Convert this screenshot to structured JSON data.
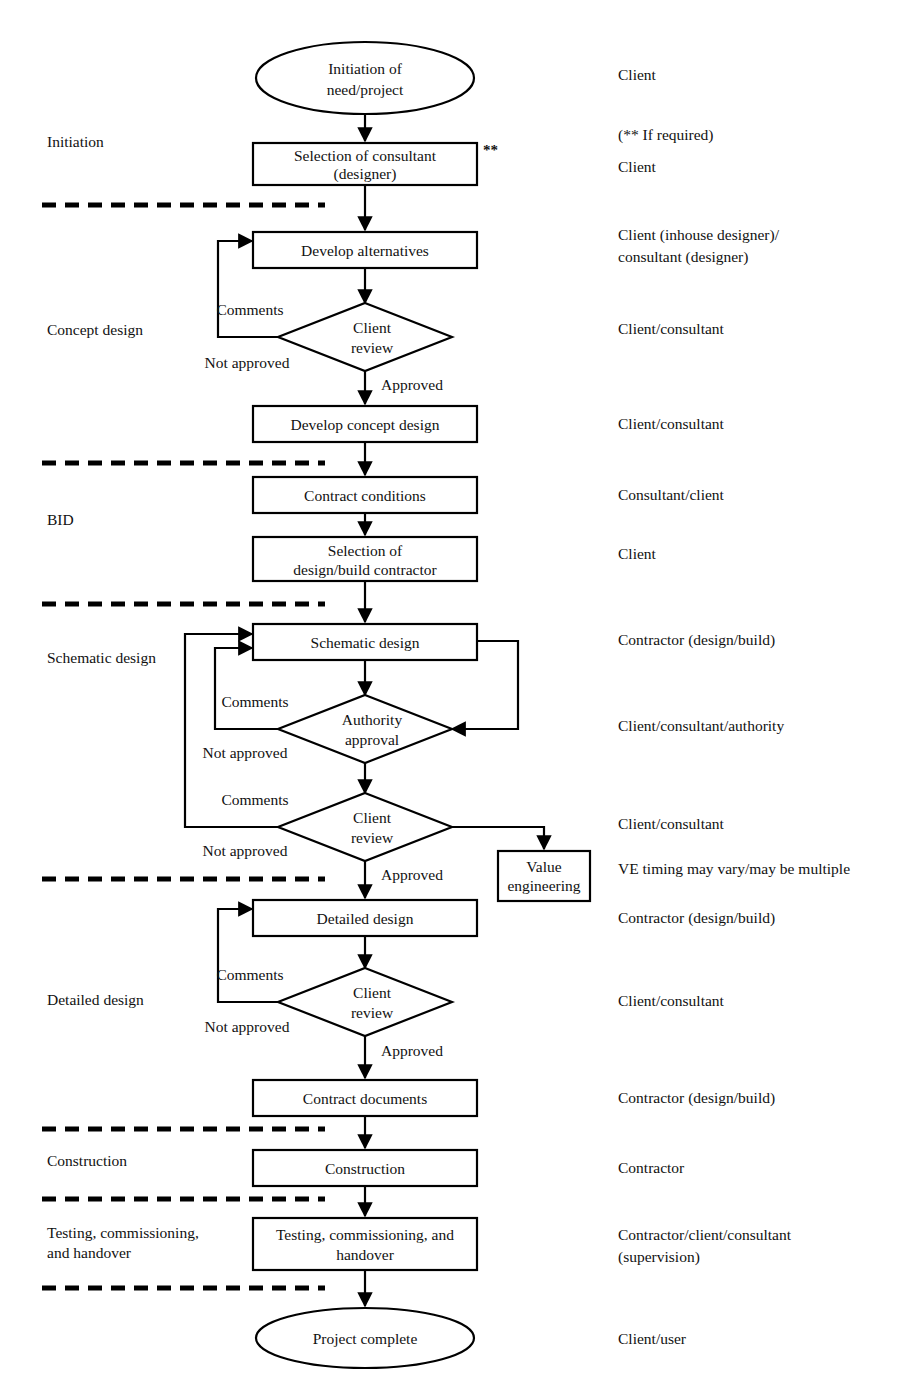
{
  "diagram": {
    "stroke_color": "#000000",
    "fill_color": "#ffffff"
  },
  "nodes": {
    "initiation_of_need": {
      "line1": "Initiation of",
      "line2": "need/project",
      "shape": "ellipse"
    },
    "selection_of_consultant": {
      "line1": "Selection of consultant",
      "line2": "(designer)",
      "shape": "process"
    },
    "develop_alternatives": {
      "line1": "Develop alternatives",
      "shape": "process"
    },
    "client_review_concept": {
      "line1": "Client",
      "line2": "review",
      "shape": "decision"
    },
    "develop_concept_design": {
      "line1": "Develop concept design",
      "shape": "process"
    },
    "contract_conditions": {
      "line1": "Contract conditions",
      "shape": "process"
    },
    "selection_of_contractor": {
      "line1": "Selection of",
      "line2": "design/build contractor",
      "shape": "process"
    },
    "schematic_design": {
      "line1": "Schematic design",
      "shape": "process"
    },
    "authority_approval": {
      "line1": "Authority",
      "line2": "approval",
      "shape": "decision"
    },
    "client_review_schematic": {
      "line1": "Client",
      "line2": "review",
      "shape": "decision"
    },
    "value_engineering": {
      "line1": "Value",
      "line2": "engineering",
      "shape": "process"
    },
    "detailed_design": {
      "line1": "Detailed design",
      "shape": "process"
    },
    "client_review_detailed": {
      "line1": "Client",
      "line2": "review",
      "shape": "decision"
    },
    "contract_documents": {
      "line1": "Contract documents",
      "shape": "process"
    },
    "construction": {
      "line1": "Construction",
      "shape": "process"
    },
    "testing_commissioning": {
      "line1": "Testing, commissioning, and",
      "line2": "handover",
      "shape": "process"
    },
    "project_complete": {
      "line1": "Project complete",
      "shape": "ellipse"
    }
  },
  "markers": {
    "consultant_asterisk": "**"
  },
  "edge_labels": {
    "concept_comments": "Comments",
    "concept_not_approved": "Not approved",
    "concept_approved": "Approved",
    "schematic_authority_comments": "Comments",
    "schematic_authority_not_approved": "Not approved",
    "schematic_client_comments": "Comments",
    "schematic_client_not_approved": "Not approved",
    "schematic_approved": "Approved",
    "detailed_comments": "Comments",
    "detailed_not_approved": "Not approved",
    "detailed_approved": "Approved"
  },
  "phases": [
    {
      "key": "initiation",
      "label": "Initiation"
    },
    {
      "key": "concept_design",
      "label": "Concept design"
    },
    {
      "key": "bid",
      "label": "BID"
    },
    {
      "key": "schematic_design",
      "label": "Schematic design"
    },
    {
      "key": "detailed_design",
      "label": "Detailed design"
    },
    {
      "key": "construction",
      "label": "Construction"
    },
    {
      "key": "testing_l1",
      "label": "Testing, commissioning,"
    },
    {
      "key": "testing_l2",
      "label": "and handover"
    }
  ],
  "actors": [
    {
      "key": "a_initiation",
      "label": "Client"
    },
    {
      "key": "a_if_required",
      "label": "(**  If required)"
    },
    {
      "key": "a_selection_consultant",
      "label": "Client"
    },
    {
      "key": "a_alternatives_l1",
      "label": "Client (inhouse designer)/"
    },
    {
      "key": "a_alternatives_l2",
      "label": "consultant (designer)"
    },
    {
      "key": "a_client_review_concept",
      "label": "Client/consultant"
    },
    {
      "key": "a_concept_design",
      "label": "Client/consultant"
    },
    {
      "key": "a_contract_conditions",
      "label": "Consultant/client"
    },
    {
      "key": "a_selection_contractor",
      "label": "Client"
    },
    {
      "key": "a_schematic_design",
      "label": "Contractor (design/build)"
    },
    {
      "key": "a_authority_approval",
      "label": "Client/consultant/authority"
    },
    {
      "key": "a_client_review_schematic",
      "label": "Client/consultant"
    },
    {
      "key": "a_value_engineering",
      "label": "VE timing may vary/may be multiple"
    },
    {
      "key": "a_detailed_design",
      "label": "Contractor (design/build)"
    },
    {
      "key": "a_client_review_detailed",
      "label": "Client/consultant"
    },
    {
      "key": "a_contract_documents",
      "label": "Contractor (design/build)"
    },
    {
      "key": "a_construction",
      "label": "Contractor"
    },
    {
      "key": "a_testing_l1",
      "label": "Contractor/client/consultant"
    },
    {
      "key": "a_testing_l2",
      "label": "(supervision)"
    },
    {
      "key": "a_project_complete",
      "label": "Client/user"
    }
  ]
}
